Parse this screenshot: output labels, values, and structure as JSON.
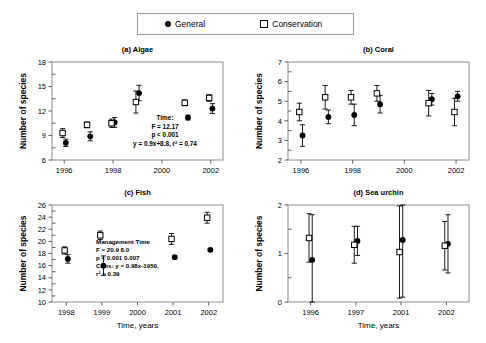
{
  "legend": {
    "items": [
      {
        "label": "General",
        "marker": "filled-circle-icon"
      },
      {
        "label": "Conservation",
        "marker": "open-square-icon"
      }
    ]
  },
  "axis_titles": {
    "y": "Number of species",
    "x": "Time, years"
  },
  "chart_data": [
    {
      "type": "scatter",
      "id": "algae",
      "title": "(a) Algae",
      "xlabel": "",
      "ylabel": "Number of species",
      "xlim": [
        1995.5,
        2002.5
      ],
      "ylim": [
        6,
        18
      ],
      "yticks": [
        6,
        9,
        12,
        15,
        18
      ],
      "xticks": [
        1996,
        1998,
        2000,
        2002
      ],
      "xticklabels": [
        "1996",
        "1998",
        "2000",
        "2002"
      ],
      "grid": false,
      "series": [
        {
          "name": "General",
          "marker": "filled-circle",
          "x": [
            1996,
            1997,
            1998,
            1999,
            2001,
            2002
          ],
          "y": [
            8.1,
            8.9,
            10.6,
            14.2,
            11.2,
            12.3
          ],
          "err": [
            0.45,
            0.55,
            0.6,
            0.95,
            0.3,
            0.6
          ]
        },
        {
          "name": "Conservation",
          "marker": "open-square",
          "x": [
            1996,
            1997,
            1998,
            1999,
            2001,
            2002
          ],
          "y": [
            9.3,
            10.3,
            10.5,
            13.1,
            13.0,
            13.6
          ],
          "err": [
            0.55,
            0.35,
            0.5,
            1.35,
            0.35,
            0.4
          ]
        }
      ],
      "annotation": [
        "Time:",
        "F = 12.17",
        "p < 0.001",
        "y = 0.9x+8.8, r² = 0.74"
      ]
    },
    {
      "type": "scatter",
      "id": "coral",
      "title": "(b) Coral",
      "xlabel": "",
      "ylabel": "Number of species",
      "xlim": [
        1995.5,
        2002.5
      ],
      "ylim": [
        2,
        7
      ],
      "yticks": [
        2,
        3,
        4,
        5,
        6,
        7
      ],
      "xticks": [
        1996,
        1998,
        2000,
        2002
      ],
      "xticklabels": [
        "1996",
        "1998",
        "2000",
        "2002"
      ],
      "grid": false,
      "series": [
        {
          "name": "General",
          "marker": "filled-circle",
          "x": [
            1996,
            1997,
            1998,
            1999,
            2001,
            2002
          ],
          "y": [
            3.25,
            4.2,
            4.3,
            4.85,
            5.1,
            5.25
          ],
          "err": [
            0.55,
            0.35,
            0.55,
            0.45,
            0.3,
            0.25
          ]
        },
        {
          "name": "Conservation",
          "marker": "open-square",
          "x": [
            1996,
            1997,
            1998,
            1999,
            2001,
            2002
          ],
          "y": [
            4.45,
            5.2,
            5.2,
            5.4,
            4.9,
            4.45
          ],
          "err": [
            0.45,
            0.6,
            0.35,
            0.4,
            0.65,
            0.7
          ]
        }
      ],
      "annotation": []
    },
    {
      "type": "scatter",
      "id": "fish",
      "title": "(c) Fish",
      "xlabel": "Time, years",
      "ylabel": "Number of species",
      "xlim": [
        1997.6,
        2002.4
      ],
      "ylim": [
        10,
        26
      ],
      "yticks": [
        10,
        12,
        14,
        16,
        18,
        20,
        22,
        24,
        26
      ],
      "xticks": [
        1998,
        1999,
        2000,
        2001,
        2002
      ],
      "xticklabels": [
        "1998",
        "1999",
        "2000",
        "2001",
        "2002"
      ],
      "grid": false,
      "series": [
        {
          "name": "General",
          "marker": "filled-circle",
          "x": [
            1998,
            1999,
            2001,
            2002
          ],
          "y": [
            17.1,
            16.0,
            17.4,
            18.6
          ],
          "err": [
            0.7,
            1.6,
            0.2,
            0.2
          ]
        },
        {
          "name": "Conservation",
          "marker": "open-square",
          "x": [
            1998,
            1999,
            2001,
            2002
          ],
          "y": [
            18.5,
            21.0,
            20.4,
            23.9
          ],
          "err": [
            0.6,
            0.7,
            0.9,
            0.9
          ]
        }
      ],
      "annotation": [
        "Management  Time",
        "F = 20.9          8.0",
        "p < 0.001      0.007",
        "Cons: y = 0.98x-1950,",
        "r² = 0.39"
      ]
    },
    {
      "type": "scatter",
      "id": "sea-urchin",
      "title": "(d) Sea urchin",
      "xlabel": "Time, years",
      "ylabel": "Number of species",
      "xlim": [
        -0.5,
        3.5
      ],
      "ylim": [
        0,
        2
      ],
      "yticks": [
        0,
        1,
        2
      ],
      "xticks": [
        0,
        1,
        2,
        3
      ],
      "xticklabels": [
        "1996",
        "1997",
        "2001",
        "2002"
      ],
      "grid": false,
      "series": [
        {
          "name": "General",
          "marker": "filled-circle",
          "x": [
            0,
            1,
            2,
            3
          ],
          "y": [
            0.87,
            1.26,
            1.28,
            1.2
          ],
          "err": [
            0.93,
            0.3,
            1.18,
            0.6
          ]
        },
        {
          "name": "Conservation",
          "marker": "open-square",
          "x": [
            0,
            1,
            2,
            3
          ],
          "y": [
            1.32,
            1.18,
            1.03,
            1.16
          ],
          "err": [
            0.5,
            0.38,
            0.95,
            0.5
          ]
        }
      ],
      "annotation": []
    }
  ]
}
